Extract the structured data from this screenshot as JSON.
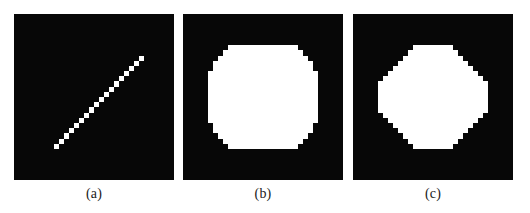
{
  "figure": {
    "background_color": "#ffffff",
    "panel_background_color": "#070707",
    "foreground_color": "#ffffff",
    "caption_color": "#1b1b1b",
    "panels": [
      {
        "id": "a",
        "caption": "(a)",
        "content_name": "rasterized-diagonal-line",
        "description": "Digitized straight line rendered as a chain of square pixel blocks running from lower-left to upper-right."
      },
      {
        "id": "b",
        "caption": "(b)",
        "content_name": "rasterized-disk-coarse",
        "description": "Digitized filled circle with nearly square outline and shallow single-step corners."
      },
      {
        "id": "c",
        "caption": "(c)",
        "content_name": "rasterized-disk-octagonal",
        "description": "Digitized filled circle with octagonal outline and long 45 degree stepped corners."
      }
    ]
  },
  "chart_data": {
    "type": "heatmap",
    "title": "",
    "xlabel": "",
    "ylabel": "",
    "grid": false,
    "legend": null,
    "panel_grid_size": 32,
    "pixel_size_px": 5,
    "panels": [
      {
        "id": "a",
        "caption": "(a)",
        "type": "line",
        "rendering": "bresenham raster",
        "grid": 32,
        "pixel_run_length": 18,
        "start_cell": [
          8,
          25
        ],
        "end_cell": [
          25,
          8
        ],
        "slope": -1.0,
        "cells": [
          [
            8,
            25
          ],
          [
            9,
            24
          ],
          [
            10,
            23
          ],
          [
            11,
            22
          ],
          [
            12,
            21
          ],
          [
            13,
            20
          ],
          [
            14,
            19
          ],
          [
            15,
            18
          ],
          [
            16,
            17
          ],
          [
            17,
            16
          ],
          [
            18,
            15
          ],
          [
            19,
            14
          ],
          [
            20,
            13
          ],
          [
            21,
            12
          ],
          [
            22,
            11
          ],
          [
            23,
            10
          ],
          [
            24,
            9
          ],
          [
            25,
            8
          ]
        ]
      },
      {
        "id": "b",
        "caption": "(b)",
        "type": "disk",
        "rendering": "coarse raster",
        "grid": 32,
        "center_cell": [
          16,
          16
        ],
        "radius_cells": 10.5,
        "row_half_widths": [
          {
            "row": 6,
            "x_start": 9,
            "x_end": 22
          },
          {
            "row": 7,
            "x_start": 8,
            "x_end": 23
          },
          {
            "row": 8,
            "x_start": 7,
            "x_end": 24
          },
          {
            "row": 9,
            "x_start": 6,
            "x_end": 25
          },
          {
            "row": 10,
            "x_start": 6,
            "x_end": 25
          },
          {
            "row": 11,
            "x_start": 5,
            "x_end": 26
          },
          {
            "row": 12,
            "x_start": 5,
            "x_end": 26
          },
          {
            "row": 13,
            "x_start": 5,
            "x_end": 26
          },
          {
            "row": 14,
            "x_start": 5,
            "x_end": 26
          },
          {
            "row": 15,
            "x_start": 5,
            "x_end": 26
          },
          {
            "row": 16,
            "x_start": 5,
            "x_end": 26
          },
          {
            "row": 17,
            "x_start": 5,
            "x_end": 26
          },
          {
            "row": 18,
            "x_start": 5,
            "x_end": 26
          },
          {
            "row": 19,
            "x_start": 5,
            "x_end": 26
          },
          {
            "row": 20,
            "x_start": 5,
            "x_end": 26
          },
          {
            "row": 21,
            "x_start": 6,
            "x_end": 25
          },
          {
            "row": 22,
            "x_start": 6,
            "x_end": 25
          },
          {
            "row": 23,
            "x_start": 7,
            "x_end": 24
          },
          {
            "row": 24,
            "x_start": 8,
            "x_end": 23
          },
          {
            "row": 25,
            "x_start": 9,
            "x_end": 22
          }
        ]
      },
      {
        "id": "c",
        "caption": "(c)",
        "type": "disk",
        "rendering": "octagonal raster",
        "grid": 32,
        "center_cell": [
          16,
          16
        ],
        "radius_cells": 10.5,
        "row_half_widths": [
          {
            "row": 6,
            "x_start": 12,
            "x_end": 19
          },
          {
            "row": 7,
            "x_start": 11,
            "x_end": 20
          },
          {
            "row": 8,
            "x_start": 10,
            "x_end": 21
          },
          {
            "row": 9,
            "x_start": 9,
            "x_end": 22
          },
          {
            "row": 10,
            "x_start": 8,
            "x_end": 23
          },
          {
            "row": 11,
            "x_start": 7,
            "x_end": 24
          },
          {
            "row": 12,
            "x_start": 6,
            "x_end": 25
          },
          {
            "row": 13,
            "x_start": 5,
            "x_end": 26
          },
          {
            "row": 14,
            "x_start": 5,
            "x_end": 26
          },
          {
            "row": 15,
            "x_start": 5,
            "x_end": 26
          },
          {
            "row": 16,
            "x_start": 5,
            "x_end": 26
          },
          {
            "row": 17,
            "x_start": 5,
            "x_end": 26
          },
          {
            "row": 18,
            "x_start": 5,
            "x_end": 26
          },
          {
            "row": 19,
            "x_start": 6,
            "x_end": 25
          },
          {
            "row": 20,
            "x_start": 7,
            "x_end": 24
          },
          {
            "row": 21,
            "x_start": 8,
            "x_end": 23
          },
          {
            "row": 22,
            "x_start": 9,
            "x_end": 22
          },
          {
            "row": 23,
            "x_start": 10,
            "x_end": 21
          },
          {
            "row": 24,
            "x_start": 11,
            "x_end": 20
          },
          {
            "row": 25,
            "x_start": 12,
            "x_end": 19
          }
        ]
      }
    ]
  }
}
